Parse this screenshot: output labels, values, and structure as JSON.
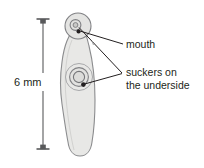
{
  "figure": {
    "background_color": "#ffffff",
    "scale": {
      "label": "6 mm",
      "value": 6,
      "unit": "mm",
      "orientation": "vertical",
      "bar_color": "#58595b",
      "top_y": 18,
      "bottom_y": 150,
      "x": 43
    },
    "organism": {
      "body_fill": "#e8e8e6",
      "body_stroke": "#8b8c8e",
      "head_fill": "#e4e4e2",
      "head_stroke": "#808184",
      "sucker_ring_color": "#808184",
      "mouth_dot_color": "#231f20"
    },
    "callouts": [
      {
        "id": "mouth",
        "label": "mouth",
        "lines": [
          "mouth"
        ],
        "text_x": 126,
        "text_y": 48,
        "leader_color": "#231f20",
        "target": "head-mouth-dot"
      },
      {
        "id": "suckers",
        "label": "suckers on the underside",
        "lines": [
          "suckers on",
          "the underside"
        ],
        "text_x": 126,
        "text_y": 78,
        "leader_color": "#231f20",
        "target": "head-sucker-and-body-sucker"
      }
    ]
  }
}
